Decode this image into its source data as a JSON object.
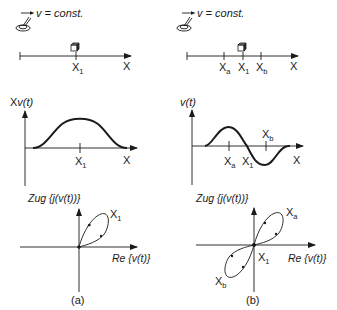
{
  "panel_a": {
    "velocity_label": "v = const.",
    "track": {
      "axis_label": "X",
      "marker": "X",
      "marker_sub": "1"
    },
    "signal": {
      "ylabel_prefix": "X",
      "ylabel_fn": "v(t)",
      "axis_label": "X",
      "marker": "X",
      "marker_sub": "1"
    },
    "polar": {
      "ylabel": "Zug {j(v(t))}",
      "xlabel": "Re {v(t)}",
      "point": "X",
      "point_sub": "1"
    },
    "caption": "(a)"
  },
  "panel_b": {
    "velocity_label": "v = const.",
    "track": {
      "axis_label": "X",
      "markers": [
        {
          "name": "X",
          "sub": "a"
        },
        {
          "name": "X",
          "sub": "1"
        },
        {
          "name": "X",
          "sub": "b"
        }
      ]
    },
    "signal": {
      "ylabel": "v(t)",
      "axis_label": "X",
      "markers": [
        {
          "name": "X",
          "sub": "a"
        },
        {
          "name": "X",
          "sub": "1"
        },
        {
          "name": "X",
          "sub": "b"
        }
      ]
    },
    "polar": {
      "ylabel": "Zug {j(v(t))}",
      "xlabel": "Re {v(t)}",
      "points": [
        {
          "name": "X",
          "sub": "a"
        },
        {
          "name": "X",
          "sub": "1"
        },
        {
          "name": "X",
          "sub": "b"
        }
      ]
    },
    "caption": "(b)"
  },
  "colors": {
    "line": "#1a1a1a",
    "background": "#ffffff"
  }
}
